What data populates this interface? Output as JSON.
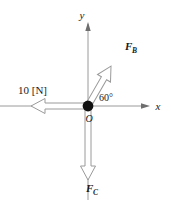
{
  "figure": {
    "kind": "force-vector-diagram",
    "background_color": "#ffffff",
    "line_color": "#9a9a9a",
    "text_color": "#1a1a1a",
    "origin_color": "#111111"
  },
  "axes": {
    "x_label": "x",
    "y_label": "y",
    "origin_label": "O"
  },
  "angle": {
    "value": "60°"
  },
  "forces": [
    {
      "id": "force-left",
      "label": "10 [N]",
      "direction": "left",
      "style": "hollow-block-arrow"
    },
    {
      "id": "force-b",
      "label": "F",
      "subscript": "B",
      "direction": "up-right-60deg",
      "style": "hollow-block-arrow"
    },
    {
      "id": "force-c",
      "label": "F",
      "subscript": "C",
      "direction": "down",
      "style": "hollow-block-arrow"
    }
  ]
}
